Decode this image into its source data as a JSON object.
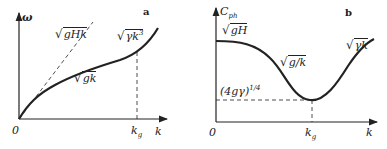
{
  "panels": [
    {
      "id": "a",
      "letter": "a",
      "y_axis_label": "ω",
      "x_axis_label": "k",
      "origin_label": "0",
      "marker_label_main": "k",
      "marker_label_sub": "g",
      "curves": [
        {
          "name": "shallow-water asymptote",
          "style": "dashed",
          "sqrt": "√",
          "radicand": "gHk"
        },
        {
          "name": "gravity branch",
          "style": "solid",
          "sqrt": "√",
          "radicand": "gk"
        },
        {
          "name": "capillary branch",
          "style": "solid",
          "sqrt": "√",
          "radicand": "γk",
          "radicand_sup": "3"
        }
      ]
    },
    {
      "id": "b",
      "letter": "b",
      "y_axis_label_main": "C",
      "y_axis_label_sub": "ph",
      "x_axis_label": "k",
      "origin_label": "0",
      "marker_label_main": "k",
      "marker_label_sub": "g",
      "curves": [
        {
          "name": "long-wave limit",
          "sqrt": "√",
          "radicand": "gH"
        },
        {
          "name": "gravity branch",
          "sqrt": "√",
          "radicand": "g/k"
        },
        {
          "name": "capillary branch",
          "sqrt": "√",
          "radicand": "γk"
        }
      ],
      "minimum_label": "(4gγ)",
      "minimum_label_sup": "1/4"
    }
  ],
  "colors": {
    "ink": "#222222",
    "background": "#ffffff"
  }
}
